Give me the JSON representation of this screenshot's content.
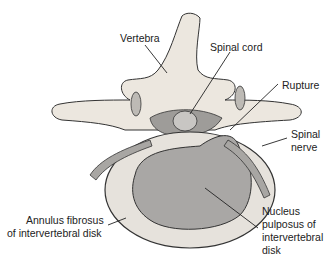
{
  "labels": {
    "vertebra": "Vertebra",
    "spinal_cord": "Spinal cord",
    "rupture": "Rupture",
    "spinal_nerve_1": "Spinal",
    "spinal_nerve_2": "nerve",
    "annulus_1": "Annulus fibrosus",
    "annulus_2": "of intervertebral disk",
    "nucleus_1": "Nucleus",
    "nucleus_2": "pulposus of",
    "nucleus_3": "intervertebral",
    "nucleus_4": "disk"
  },
  "colors": {
    "bone": "#ece7df",
    "disk": "#e6e2dc",
    "nucleus": "#a9a7a5",
    "cord": "#b5b3b0",
    "outline": "#333333"
  }
}
